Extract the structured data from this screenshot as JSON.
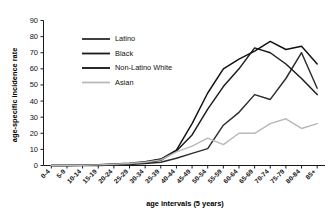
{
  "chart_data": {
    "type": "line",
    "title": "",
    "xlabel": "age intervals (5 years)",
    "ylabel": "age-specific incidence rate",
    "grid": false,
    "legend_position": "upper-left-inside",
    "ylim": [
      0,
      90
    ],
    "yticks": [
      0,
      10,
      20,
      30,
      40,
      50,
      60,
      70,
      80,
      90
    ],
    "categories": [
      "0-4",
      "5-9",
      "10-14",
      "15-19",
      "20-24",
      "25-29",
      "30-34",
      "35-39",
      "40-44",
      "45-49",
      "50-54",
      "55-59",
      "60-64",
      "65-69",
      "70-74",
      "75-79",
      "80-84",
      "85+"
    ],
    "series": [
      {
        "name": "Latino",
        "color": "#2b2b2b",
        "values": [
          0,
          0,
          0,
          0,
          0.3,
          0.6,
          1.2,
          2.0,
          4.5,
          7.5,
          10.5,
          25,
          33,
          44,
          41,
          54,
          70,
          48
        ]
      },
      {
        "name": "Black",
        "color": "#1a1a1a",
        "values": [
          0,
          0,
          0.2,
          0.4,
          0.7,
          1.0,
          1.8,
          3.2,
          9.0,
          19,
          35,
          49,
          60,
          73,
          70,
          63,
          54,
          44
        ]
      },
      {
        "name": "Non-Latino White",
        "color": "#111111",
        "values": [
          0,
          0,
          0.2,
          0.5,
          0.9,
          1.4,
          2.4,
          4.0,
          9.5,
          26,
          45,
          60,
          66,
          71,
          77,
          72,
          74,
          63
        ]
      },
      {
        "name": "Asian",
        "color": "#b9b9b9",
        "values": [
          0,
          0,
          0.2,
          0.4,
          0.8,
          1.2,
          2.0,
          3.5,
          8.5,
          12,
          17,
          13,
          20,
          20,
          26,
          29,
          23,
          26
        ]
      }
    ]
  },
  "axis": {
    "ylabel": "age-specific incidence rate",
    "xlabel": "age intervals (5 years)"
  }
}
